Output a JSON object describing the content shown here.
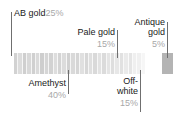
{
  "diagram": {
    "type": "bead-palette-callout",
    "background": "#ffffff",
    "line_color": "#6f6f6f",
    "name_color": "#1a1a1a",
    "pct_color": "#a8a8a8"
  },
  "labels": {
    "ab_gold": {
      "name": "AB gold",
      "pct": "25%"
    },
    "pale_gold": {
      "name": "Pale gold",
      "pct": "15%"
    },
    "antique_gold_line1": {
      "name": "Antique"
    },
    "antique_gold_line2": {
      "name": "gold",
      "pct": "5%"
    },
    "amethyst": {
      "name": "Amethyst",
      "pct": "40%"
    },
    "off_white_line1": {
      "name": "Off-"
    },
    "off_white_line2": {
      "name": "white",
      "pct": "15%"
    }
  },
  "chart_data": {
    "type": "bar",
    "title": "",
    "xlabel": "",
    "ylabel": "",
    "categories": [
      "Amethyst",
      "AB gold",
      "Pale gold",
      "Off-white",
      "Antique gold"
    ],
    "values": [
      40,
      25,
      15,
      15,
      5
    ],
    "value_labels": [
      "40%",
      "25%",
      "15%",
      "15%",
      "5%"
    ],
    "colors": [
      "#d9d9d9",
      "#cfcfcf",
      "#e3e3e3",
      "#f2f2f2",
      "#b9b9b9"
    ],
    "legend": "callout-labels",
    "grid": false
  },
  "strip": {
    "x": 14,
    "y": 53,
    "width": 131,
    "height": 21,
    "segment_tones": [
      "#d2d2d2",
      "#dcdcdc",
      "#cfcfcf",
      "#d8d8d8",
      "#d0d0d0",
      "#dadada",
      "#cecece",
      "#d6d6d6",
      "#d2d2d2",
      "#dddddd",
      "#d4d4d4",
      "#dcdcdc",
      "#d1d1d1",
      "#d9d9d9",
      "#d5d5d5",
      "#e0e0e0",
      "#d7d7d7",
      "#dfdfdf",
      "#d9d9d9",
      "#e2e2e2",
      "#dbdbdb",
      "#e4e4e4",
      "#dedede",
      "#e7e7e7",
      "#e1e1e1",
      "#eaeaea",
      "#e5e5e5",
      "#efefef",
      "#f0f0f0",
      "#f6f6f6"
    ]
  },
  "swatch": {
    "x": 162,
    "y": 53,
    "width": 11,
    "height": 21,
    "tone": "#b4b4b4"
  }
}
